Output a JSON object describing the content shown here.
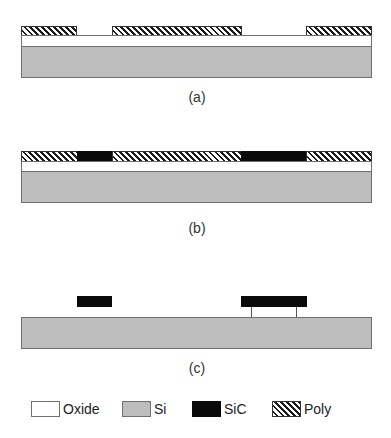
{
  "panels": [
    {
      "id": "a",
      "caption": "(a)",
      "layers": [
        "Poly (patterned)",
        "Oxide",
        "Si"
      ]
    },
    {
      "id": "b",
      "caption": "(b)",
      "layers": [
        "Poly + SiC (in openings)",
        "Oxide",
        "Si"
      ]
    },
    {
      "id": "c",
      "caption": "(c)",
      "layers": [
        "SiC (released, anchored)",
        "Si"
      ]
    }
  ],
  "legend": [
    {
      "material": "Oxide",
      "label": "Oxide",
      "color": "#ffffff"
    },
    {
      "material": "Si",
      "label": "Si",
      "color": "#bdbdbd"
    },
    {
      "material": "SiC",
      "label": "SiC",
      "color": "#0a0a0a"
    },
    {
      "material": "Poly",
      "label": "Poly",
      "pattern": "diagonal-hatch"
    }
  ]
}
